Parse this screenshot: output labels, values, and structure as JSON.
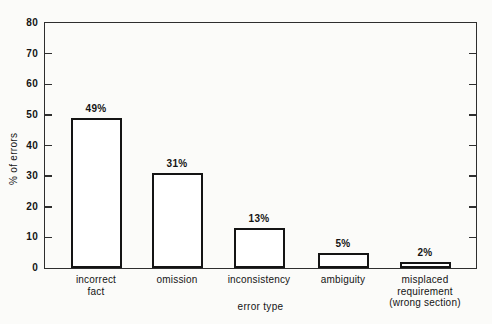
{
  "figure": {
    "background": "#fbfbf9"
  },
  "chart_data": {
    "type": "bar",
    "title": "",
    "xlabel": "error type",
    "ylabel": "% of errors",
    "categories": [
      "incorrect fact",
      "omission",
      "inconsistency",
      "ambiguity",
      "misplaced requirement (wrong section)"
    ],
    "values": [
      49,
      31,
      13,
      5,
      2
    ],
    "value_labels": [
      "49%",
      "31%",
      "13%",
      "5%",
      "2%"
    ],
    "ylim": [
      0,
      80
    ],
    "ytick_step": 10,
    "ytick_labels": [
      "0",
      "10",
      "20",
      "30",
      "40",
      "50",
      "60",
      "70",
      "80"
    ],
    "grid": false,
    "legend": "none",
    "colors": {
      "background": "#fbfbf9",
      "bar_fill": "#ffffff",
      "bar_outline": "#141414",
      "axis": "#2e2e2e",
      "text": "#141414"
    },
    "layout": {
      "plot": {
        "x": 45,
        "y": 23,
        "w": 431,
        "h": 245
      },
      "bar_centers": [
        96,
        177,
        259,
        343,
        425
      ],
      "bar_width": 51,
      "tick_len": 7,
      "category_lines": [
        [
          "incorrect",
          "fact"
        ],
        [
          "omission"
        ],
        [
          "inconsistency"
        ],
        [
          "ambiguity"
        ],
        [
          "misplaced",
          "requirement",
          "(wrong section)"
        ]
      ],
      "xlabel_top": 301,
      "cat_label_top": 274
    }
  }
}
